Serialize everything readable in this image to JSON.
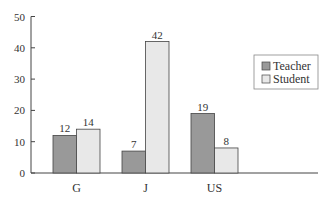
{
  "chart_data": {
    "type": "bar",
    "title": "",
    "xlabel": "",
    "ylabel": "",
    "categories": [
      "G",
      "J",
      "US"
    ],
    "series": [
      {
        "name": "Teacher",
        "values": [
          12,
          7,
          19
        ],
        "color": "#999999"
      },
      {
        "name": "Student",
        "values": [
          14,
          42,
          8
        ],
        "color": "#e8e8e8"
      }
    ],
    "ylim": [
      0,
      50
    ],
    "yticks": [
      0,
      10,
      20,
      30,
      40,
      50
    ],
    "grid": false,
    "legend_position": "right",
    "data_labels": true
  }
}
